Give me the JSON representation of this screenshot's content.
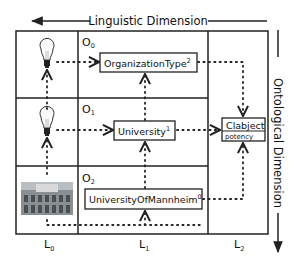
{
  "diagram": {
    "linguistic_dimension": {
      "label": "Linguistic Dimension",
      "direction": "left"
    },
    "ontological_dimension": {
      "label": "Ontological Dimension",
      "direction": "down"
    },
    "rows": [
      {
        "level": "O",
        "sub": "0"
      },
      {
        "level": "O",
        "sub": "1"
      },
      {
        "level": "O",
        "sub": "2"
      }
    ],
    "columns": [
      {
        "level": "L",
        "sub": "0"
      },
      {
        "level": "L",
        "sub": "1"
      },
      {
        "level": "L",
        "sub": "2"
      }
    ],
    "nodes": {
      "organization_type": {
        "name": "OrganizationType",
        "potency": "2"
      },
      "university": {
        "name": "University",
        "potency": "1"
      },
      "university_of_mannheim": {
        "name": "UniversityOfMannheim",
        "potency": "0"
      },
      "clabject": {
        "name": "Clabject",
        "attribute": "potency"
      }
    },
    "icons": {
      "row0": "lightbulb-icon",
      "row1": "lightbulb-icon",
      "row2": "building-photo"
    },
    "colors": {
      "line": "#222222",
      "background": "#ffffff"
    }
  }
}
